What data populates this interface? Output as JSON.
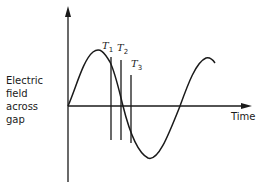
{
  "diagram": {
    "y_axis_label_lines": [
      "Electric",
      "field",
      "across",
      "gap"
    ],
    "x_axis_label": "Time",
    "markers": [
      {
        "label": "T",
        "subscript": "1"
      },
      {
        "label": "T",
        "subscript": "2"
      },
      {
        "label": "T",
        "subscript": "3"
      }
    ],
    "curve": "sine wave",
    "line_color": "#1a1a1a"
  }
}
